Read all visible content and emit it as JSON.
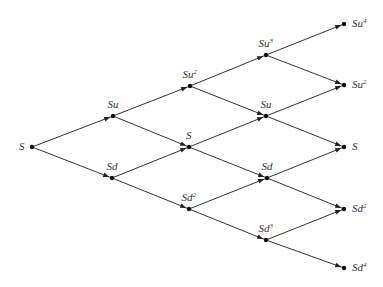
{
  "diagram": {
    "colors": {
      "line": "#333333",
      "node": "#111111",
      "background": "#ffffff"
    },
    "nodes": [
      {
        "id": "n0_0",
        "base": "S",
        "exp": "",
        "x": 32,
        "y": 147,
        "label_pos": "left"
      },
      {
        "id": "n1_0",
        "base": "Su",
        "exp": "",
        "x": 113,
        "y": 116,
        "label_pos": "above"
      },
      {
        "id": "n1_1",
        "base": "Sd",
        "exp": "",
        "x": 112,
        "y": 178,
        "label_pos": "above"
      },
      {
        "id": "n2_0",
        "base": "Su",
        "exp": "2",
        "x": 190,
        "y": 86,
        "label_pos": "above"
      },
      {
        "id": "n2_1",
        "base": "S",
        "exp": "",
        "x": 189,
        "y": 147,
        "label_pos": "above"
      },
      {
        "id": "n2_2",
        "base": "Sd",
        "exp": "2",
        "x": 189,
        "y": 209,
        "label_pos": "above"
      },
      {
        "id": "n3_0",
        "base": "Su",
        "exp": "3",
        "x": 266,
        "y": 55,
        "label_pos": "above"
      },
      {
        "id": "n3_1",
        "base": "Su",
        "exp": "",
        "x": 266,
        "y": 116,
        "label_pos": "above"
      },
      {
        "id": "n3_2",
        "base": "Sd",
        "exp": "",
        "x": 267,
        "y": 178,
        "label_pos": "above"
      },
      {
        "id": "n3_3",
        "base": "Sd",
        "exp": "3",
        "x": 266,
        "y": 240,
        "label_pos": "above"
      },
      {
        "id": "n4_0",
        "base": "Su",
        "exp": "4",
        "x": 344,
        "y": 24,
        "label_pos": "right"
      },
      {
        "id": "n4_1",
        "base": "Su",
        "exp": "2",
        "x": 344,
        "y": 85,
        "label_pos": "right"
      },
      {
        "id": "n4_2",
        "base": "S",
        "exp": "",
        "x": 344,
        "y": 147,
        "label_pos": "right"
      },
      {
        "id": "n4_3",
        "base": "Sd",
        "exp": "2",
        "x": 344,
        "y": 209,
        "label_pos": "right"
      },
      {
        "id": "n4_4",
        "base": "Sd",
        "exp": "4",
        "x": 344,
        "y": 268,
        "label_pos": "right"
      }
    ],
    "edges": [
      [
        "n0_0",
        "n1_0"
      ],
      [
        "n0_0",
        "n1_1"
      ],
      [
        "n1_0",
        "n2_0"
      ],
      [
        "n1_0",
        "n2_1"
      ],
      [
        "n1_1",
        "n2_1"
      ],
      [
        "n1_1",
        "n2_2"
      ],
      [
        "n2_0",
        "n3_0"
      ],
      [
        "n2_0",
        "n3_1"
      ],
      [
        "n2_1",
        "n3_1"
      ],
      [
        "n2_1",
        "n3_2"
      ],
      [
        "n2_2",
        "n3_2"
      ],
      [
        "n2_2",
        "n3_3"
      ],
      [
        "n3_0",
        "n4_0"
      ],
      [
        "n3_0",
        "n4_1"
      ],
      [
        "n3_1",
        "n4_1"
      ],
      [
        "n3_1",
        "n4_2"
      ],
      [
        "n3_2",
        "n4_2"
      ],
      [
        "n3_2",
        "n4_3"
      ],
      [
        "n3_3",
        "n4_3"
      ],
      [
        "n3_3",
        "n4_4"
      ]
    ]
  }
}
